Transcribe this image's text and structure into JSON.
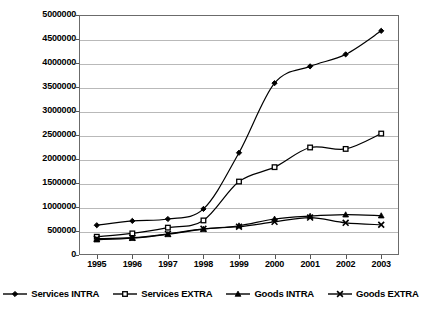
{
  "chart_data": {
    "type": "line",
    "title": "",
    "subtitle": "",
    "xlabel": "",
    "ylabel": "",
    "categories": [
      "1995",
      "1996",
      "1997",
      "1998",
      "1999",
      "2000",
      "2001",
      "2002",
      "2003"
    ],
    "ylim": [
      0,
      5000000
    ],
    "ytick_values": [
      0,
      500000,
      1000000,
      1500000,
      2000000,
      2500000,
      3000000,
      3500000,
      4000000,
      4500000,
      5000000
    ],
    "ytick_labels": [
      "0",
      "500000",
      "1000000",
      "1500000",
      "2000000",
      "2500000",
      "3000000",
      "3500000",
      "4000000",
      "4500000",
      "5000000"
    ],
    "grid": true,
    "legend_position": "bottom",
    "series": [
      {
        "name": "Services INTRA",
        "marker": "diamond",
        "color": "#000000",
        "values": [
          620000,
          710000,
          750000,
          960000,
          2130000,
          3580000,
          3930000,
          4180000,
          4670000
        ]
      },
      {
        "name": "Services EXTRA",
        "marker": "square",
        "color": "#000000",
        "values": [
          380000,
          450000,
          570000,
          720000,
          1530000,
          1830000,
          2240000,
          2210000,
          2530000
        ]
      },
      {
        "name": "Goods INTRA",
        "marker": "triangle",
        "color": "#000000",
        "values": [
          320000,
          350000,
          430000,
          540000,
          610000,
          750000,
          810000,
          840000,
          820000
        ]
      },
      {
        "name": "Goods EXTRA",
        "marker": "cross-x",
        "color": "#000000",
        "values": [
          340000,
          360000,
          440000,
          545000,
          590000,
          690000,
          780000,
          670000,
          630000
        ]
      }
    ]
  },
  "style": {
    "plot_border_color": "#6b6b6b",
    "gridline_color": "#b9b9b9",
    "background": "#ffffff",
    "line_color": "#000000"
  }
}
